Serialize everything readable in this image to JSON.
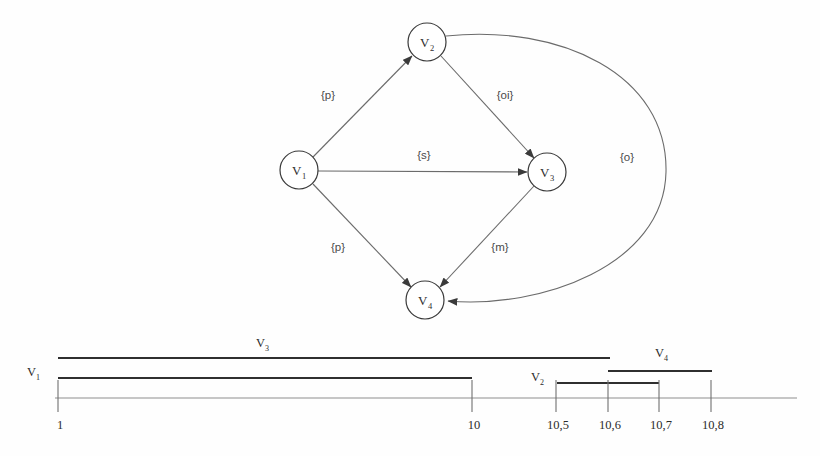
{
  "figure": {
    "title": "",
    "background_color": "#fefefe",
    "stroke_color": "#6b6b6b",
    "node_stroke_color": "#3a3a3a",
    "bar_color": "#2f2f2f",
    "axis_color": "#8d8d8d"
  },
  "graph": {
    "nodes": [
      {
        "id": "v1",
        "base": "V",
        "sub": "1",
        "cx": 299,
        "cy": 170,
        "r": 19
      },
      {
        "id": "v2",
        "base": "V",
        "sub": "2",
        "cx": 427,
        "cy": 42,
        "r": 19
      },
      {
        "id": "v3",
        "base": "V",
        "sub": "3",
        "cx": 547,
        "cy": 172,
        "r": 19
      },
      {
        "id": "v4",
        "base": "V",
        "sub": "4",
        "cx": 425,
        "cy": 300,
        "r": 19
      }
    ],
    "edges": [
      {
        "id": "e-v1-v2",
        "from": "v1",
        "to": "v2",
        "label": "{p}",
        "label_x": 328,
        "label_y": 99
      },
      {
        "id": "e-v2-v3",
        "from": "v2",
        "to": "v3",
        "label": "{oi}",
        "label_x": 505,
        "label_y": 99
      },
      {
        "id": "e-v1-v3",
        "from": "v1",
        "to": "v3",
        "label": "{s}",
        "label_x": 424,
        "label_y": 159
      },
      {
        "id": "e-v1-v4",
        "from": "v1",
        "to": "v4",
        "label": "{p}",
        "label_x": 338,
        "label_y": 251
      },
      {
        "id": "e-v3-v4",
        "from": "v3",
        "to": "v4",
        "label": "{m}",
        "label_x": 500,
        "label_y": 251
      },
      {
        "id": "e-v2-v4",
        "from": "v2",
        "to": "v4",
        "label": "{o}",
        "label_x": 627,
        "label_y": 161
      }
    ]
  },
  "timeline": {
    "axis": {
      "x_start": 55,
      "x_end": 797,
      "y": 398
    },
    "ticks": [
      {
        "label": "1",
        "x": 58
      },
      {
        "label": "10",
        "x": 472
      },
      {
        "label": "10,5",
        "x": 556
      },
      {
        "label": "10,6",
        "x": 608
      },
      {
        "label": "10,7",
        "x": 659
      },
      {
        "label": "10,8",
        "x": 711
      }
    ],
    "tick_label_y": 424,
    "intervals": [
      {
        "id": "bar-v3",
        "base": "V",
        "sub": "3",
        "x1": 58,
        "x2": 610,
        "y": 358,
        "label_x": 256,
        "label_y": 347
      },
      {
        "id": "bar-v4",
        "base": "V",
        "sub": "4",
        "x1": 608,
        "x2": 712,
        "y": 371,
        "label_x": 655,
        "label_y": 357
      },
      {
        "id": "bar-v1",
        "base": "V",
        "sub": "1",
        "x1": 58,
        "x2": 472,
        "y": 378,
        "label_x": 27,
        "label_y": 376
      },
      {
        "id": "bar-v2",
        "base": "V",
        "sub": "2",
        "x1": 557,
        "x2": 659,
        "y": 383,
        "label_x": 531,
        "label_y": 381
      }
    ]
  }
}
